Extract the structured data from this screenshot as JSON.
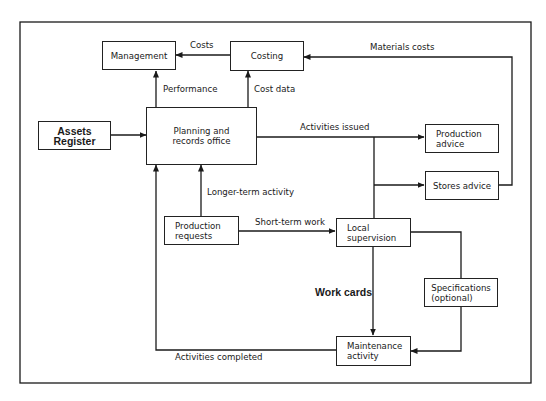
{
  "diagram": {
    "type": "flowchart",
    "nodes": {
      "management": "Management",
      "costing": "Costing",
      "assets_register": "Assets Register",
      "planning_office": [
        "Planning and",
        "records office"
      ],
      "production_advice": [
        "Production",
        "advice"
      ],
      "stores_advice": "Stores advice",
      "production_requests": [
        "Production",
        "requests"
      ],
      "local_supervision": [
        "Local",
        "supervision"
      ],
      "specifications": [
        "Specifications",
        "(optional)"
      ],
      "maintenance_activity": [
        "Maintenance",
        "activity"
      ]
    },
    "edges": {
      "costs": "Costs",
      "materials_costs": "Materials costs",
      "performance": "Performance",
      "cost_data": "Cost data",
      "activities_issued": "Activities issued",
      "longer_term_activity": "Longer-term activity",
      "short_term_work": "Short-term work",
      "work_cards": "Work cards",
      "activities_completed": "Activities completed"
    },
    "connections": [
      {
        "from": "Costing",
        "to": "Management",
        "label": "Costs"
      },
      {
        "from": "Stores advice",
        "to": "Costing",
        "label": "Materials costs"
      },
      {
        "from": "Planning and records office",
        "to": "Management",
        "label": "Performance"
      },
      {
        "from": "Planning and records office",
        "to": "Costing",
        "label": "Cost data"
      },
      {
        "from": "Assets Register",
        "to": "Planning and records office",
        "label": ""
      },
      {
        "from": "Planning and records office",
        "to": "Production advice",
        "label": "Activities issued"
      },
      {
        "from": "Planning and records office",
        "to": "Stores advice",
        "label": "Activities issued"
      },
      {
        "from": "Planning and records office",
        "to": "Local supervision",
        "label": "Activities issued"
      },
      {
        "from": "Production requests",
        "to": "Planning and records office",
        "label": "Longer-term activity"
      },
      {
        "from": "Production requests",
        "to": "Local supervision",
        "label": "Short-term work"
      },
      {
        "from": "Local supervision",
        "to": "Maintenance activity",
        "label": "Work cards"
      },
      {
        "from": "Local supervision",
        "to": "Maintenance activity",
        "via": "Specifications (optional)",
        "label": ""
      },
      {
        "from": "Maintenance activity",
        "to": "Planning and records office",
        "label": "Activities completed"
      }
    ]
  }
}
